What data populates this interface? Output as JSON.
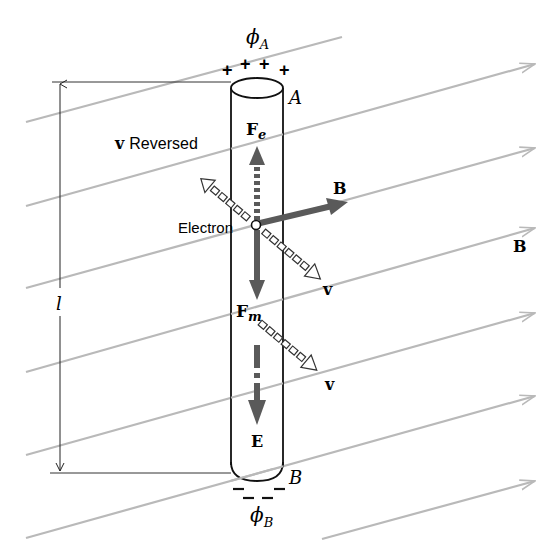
{
  "diagram": {
    "labels": {
      "phi_a": "ϕ",
      "phi_a_sub": "A",
      "phi_b": "ϕ",
      "phi_b_sub": "B",
      "plus_signs": "+ + + +",
      "end_a": "A",
      "end_b": "B",
      "length": "l",
      "f_e": "F",
      "f_e_sub": "e",
      "f_m": "F",
      "f_m_sub": "m",
      "v_reversed_bold": "v",
      "v_reversed_text": "Reversed",
      "electron": "Electron",
      "b_local": "B",
      "b_field": "B",
      "v_upper": "v",
      "v_lower": "v",
      "e_field": "E"
    },
    "colors": {
      "field_line": "#b9b9b9",
      "vector": "#5a5a5a",
      "ink": "#111111",
      "background": "#ffffff"
    },
    "field_lines": [
      {
        "x1": 26,
        "y1": 122,
        "x2": 342,
        "y2": 37,
        "arrow": false
      },
      {
        "x1": 26,
        "y1": 206,
        "x2": 535,
        "y2": 64,
        "arrow": true
      },
      {
        "x1": 26,
        "y1": 288,
        "x2": 535,
        "y2": 148,
        "arrow": true
      },
      {
        "x1": 26,
        "y1": 372,
        "x2": 535,
        "y2": 228,
        "arrow": true
      },
      {
        "x1": 26,
        "y1": 455,
        "x2": 535,
        "y2": 313,
        "arrow": true
      },
      {
        "x1": 26,
        "y1": 538,
        "x2": 535,
        "y2": 396,
        "arrow": true
      },
      {
        "x1": 322,
        "y1": 539,
        "x2": 535,
        "y2": 481,
        "arrow": true
      }
    ]
  }
}
